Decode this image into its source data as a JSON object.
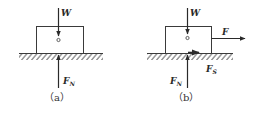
{
  "figure": {
    "panels": [
      {
        "id": "a",
        "caption": "（a）",
        "forces": {
          "weight": {
            "label": "W",
            "sub": ""
          },
          "normal": {
            "label": "F",
            "sub": "N"
          }
        }
      },
      {
        "id": "b",
        "caption": "（b）",
        "forces": {
          "weight": {
            "label": "W",
            "sub": ""
          },
          "applied": {
            "label": "F",
            "sub": ""
          },
          "friction": {
            "label": "F",
            "sub": "S"
          },
          "normal": {
            "label": "F",
            "sub": "N"
          }
        }
      }
    ],
    "colors": {
      "line": "#3a3a3a",
      "background": "#ffffff"
    }
  }
}
